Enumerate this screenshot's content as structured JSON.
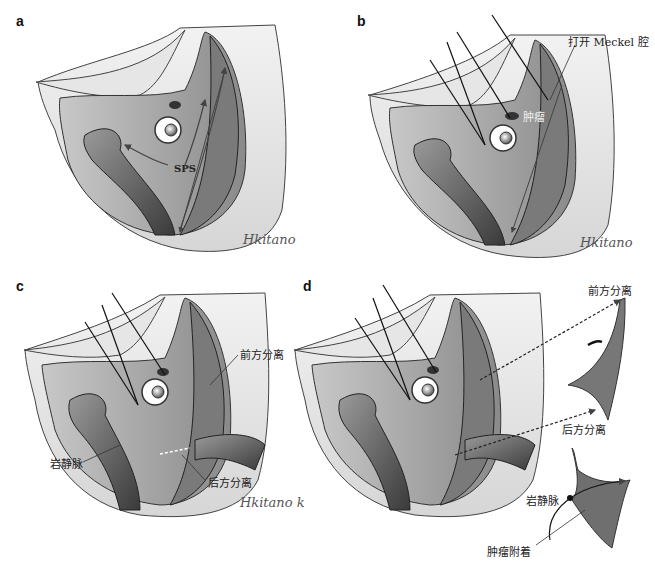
{
  "figure": {
    "panels": [
      {
        "letter": "a",
        "labels": {
          "sps": "SPS"
        },
        "signature": "Hkitano"
      },
      {
        "letter": "b",
        "labels": {
          "open_meckel": "打开 Meckel 腔",
          "tumor": "肿瘤"
        },
        "signature": "Hkitano"
      },
      {
        "letter": "c",
        "labels": {
          "anterior_dissection": "前方分离",
          "petrosal_vein": "岩静脉",
          "posterior_dissection": "后方分离"
        },
        "signature": "Hkitano k"
      },
      {
        "letter": "d",
        "labels": {
          "anterior_dissection": "前方分离",
          "posterior_dissection": "后方分离",
          "petrosal_vein": "岩静脉",
          "tumor_attachment": "肿瘤附着"
        }
      }
    ]
  }
}
